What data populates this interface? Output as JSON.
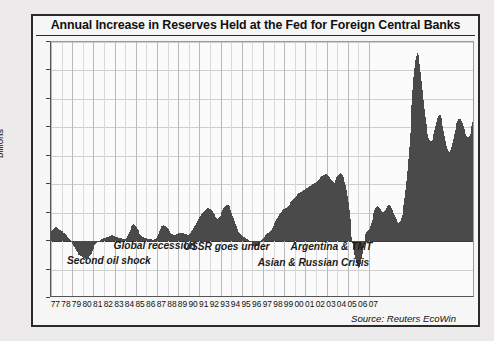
{
  "chart": {
    "title": "Annual Increase in Reserves Held at the Fed for Foreign Central Banks",
    "source": "Source: Reuters EcoWin",
    "ylabel": "billions"
  },
  "chart_data": {
    "type": "bar",
    "title": "Annual Increase in Reserves Held at the Fed for Foreign Central Banks",
    "xlabel": "",
    "ylabel": "billions",
    "ylim": [
      -100,
      350
    ],
    "yticks": [
      350,
      300,
      250,
      200,
      150,
      100,
      50,
      0,
      -50,
      -100
    ],
    "xticks": [
      "77",
      "78",
      "79",
      "80",
      "81",
      "82",
      "83",
      "84",
      "85",
      "86",
      "87",
      "88",
      "89",
      "90",
      "91",
      "92",
      "93",
      "94",
      "95",
      "96",
      "97",
      "98",
      "99",
      "00",
      "01",
      "02",
      "03",
      "04",
      "05",
      "06",
      "07"
    ],
    "grid": true,
    "legend": null,
    "bar_color": "#4a4a4a",
    "x_start_year": 1977,
    "points_per_year": 12,
    "annotations": [
      {
        "text": "Second oil shock",
        "x_year": 1978.6,
        "y_value": -38
      },
      {
        "text": "Global recession",
        "x_year": 1983.0,
        "y_value": -12
      },
      {
        "text": "USSR goes under",
        "x_year": 1989.6,
        "y_value": -14
      },
      {
        "text": "Argentina & TMT",
        "x_year": 1999.7,
        "y_value": -14
      },
      {
        "text": "Asian & Russian Crisis",
        "x_year": 1996.6,
        "y_value": -42
      }
    ],
    "values": [
      18,
      20,
      22,
      23,
      24,
      25,
      24,
      23,
      22,
      20,
      19,
      18,
      17,
      16,
      15,
      14,
      12,
      10,
      8,
      6,
      4,
      2,
      0,
      -2,
      -5,
      -8,
      -11,
      -14,
      -17,
      -20,
      -22,
      -24,
      -25,
      -26,
      -27,
      -28,
      -29,
      -30,
      -31,
      -32,
      -31,
      -30,
      -29,
      -27,
      -25,
      -22,
      -18,
      -14,
      -10,
      -7,
      -5,
      -3,
      -2,
      -1,
      0,
      1,
      2,
      3,
      4,
      5,
      6,
      6,
      7,
      7,
      8,
      8,
      9,
      9,
      10,
      10,
      9,
      9,
      8,
      8,
      7,
      7,
      6,
      6,
      5,
      5,
      4,
      4,
      3,
      3,
      4,
      6,
      9,
      12,
      16,
      20,
      24,
      27,
      29,
      30,
      29,
      27,
      25,
      22,
      19,
      16,
      13,
      11,
      9,
      8,
      7,
      6,
      6,
      5,
      5,
      4,
      4,
      3,
      3,
      3,
      2,
      2,
      2,
      3,
      4,
      6,
      9,
      13,
      17,
      21,
      24,
      26,
      27,
      28,
      27,
      26,
      25,
      23,
      21,
      19,
      17,
      15,
      13,
      12,
      11,
      10,
      10,
      11,
      12,
      13,
      14,
      14,
      15,
      15,
      14,
      14,
      13,
      13,
      12,
      12,
      11,
      11,
      12,
      14,
      16,
      18,
      20,
      23,
      26,
      29,
      32,
      35,
      38,
      41,
      43,
      45,
      47,
      49,
      51,
      53,
      55,
      56,
      57,
      58,
      58,
      57,
      56,
      55,
      53,
      50,
      47,
      44,
      42,
      40,
      39,
      40,
      42,
      45,
      48,
      52,
      55,
      58,
      60,
      62,
      63,
      64,
      63,
      61,
      58,
      54,
      50,
      45,
      40,
      35,
      30,
      26,
      22,
      19,
      16,
      14,
      12,
      10,
      9,
      8,
      7,
      6,
      5,
      4,
      3,
      2,
      1,
      0,
      -2,
      -4,
      -6,
      -8,
      -9,
      -10,
      -9,
      -8,
      -6,
      -4,
      -2,
      0,
      2,
      4,
      6,
      8,
      10,
      12,
      13,
      14,
      15,
      16,
      18,
      20,
      23,
      26,
      29,
      32,
      35,
      38,
      41,
      44,
      47,
      50,
      52,
      54,
      55,
      56,
      57,
      58,
      59,
      60,
      62,
      64,
      66,
      68,
      70,
      72,
      74,
      76,
      78,
      80,
      82,
      83,
      84,
      85,
      86,
      87,
      88,
      89,
      90,
      91,
      92,
      93,
      94,
      95,
      96,
      97,
      98,
      99,
      100,
      101,
      102,
      103,
      104,
      106,
      108,
      110,
      112,
      113,
      114,
      115,
      116,
      117,
      118,
      118,
      117,
      116,
      114,
      112,
      110,
      108,
      106,
      104,
      103,
      105,
      108,
      112,
      115,
      117,
      118,
      119,
      118,
      116,
      113,
      109,
      104,
      98,
      90,
      80,
      68,
      54,
      38,
      22,
      8,
      -4,
      -14,
      -24,
      -32,
      -38,
      -43,
      -46,
      -47,
      -45,
      -40,
      -32,
      -22,
      -12,
      -2,
      6,
      12,
      16,
      18,
      20,
      22,
      26,
      31,
      37,
      43,
      49,
      54,
      58,
      60,
      61,
      60,
      58,
      56,
      54,
      53,
      52,
      52,
      53,
      55,
      58,
      61,
      63,
      64,
      63,
      61,
      58,
      54,
      50,
      46,
      42,
      38,
      35,
      33,
      32,
      33,
      36,
      40,
      46,
      54,
      64,
      76,
      90,
      106,
      124,
      144,
      166,
      190,
      215,
      240,
      265,
      288,
      305,
      318,
      326,
      330,
      328,
      322,
      312,
      298,
      282,
      265,
      248,
      232,
      218,
      206,
      196,
      188,
      182,
      178,
      176,
      176,
      178,
      182,
      188,
      195,
      203,
      210,
      216,
      220,
      222,
      221,
      217,
      211,
      203,
      194,
      185,
      176,
      168,
      162,
      158,
      156,
      157,
      160,
      165,
      172,
      180,
      188,
      196,
      203,
      208,
      212,
      214,
      215,
      214,
      211,
      207,
      202,
      197,
      192,
      188,
      185,
      183,
      183,
      185,
      189,
      195,
      202,
      210,
      217,
      223
    ]
  }
}
